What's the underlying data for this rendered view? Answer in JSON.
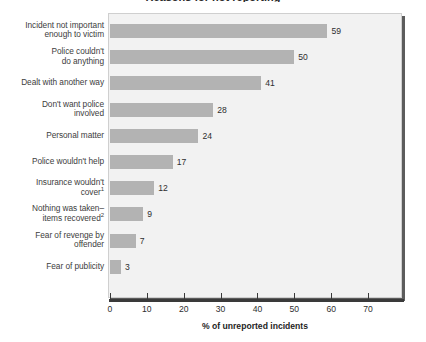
{
  "chart_data": {
    "type": "bar",
    "orientation": "horizontal",
    "title": "Reasons for not reporting",
    "xlabel": "% of unreported incidents",
    "ylabel": "",
    "xlim": [
      0,
      78
    ],
    "xticks": [
      0,
      10,
      20,
      30,
      40,
      50,
      60,
      70
    ],
    "xtick_labels": [
      "0",
      "10",
      "20",
      "30",
      "40",
      "50",
      "60",
      "70"
    ],
    "grid": false,
    "legend": null,
    "categories": [
      "Incident not important enough to victim",
      "Police couldn't do anything",
      "Dealt with another way",
      "Don't want police involved",
      "Personal matter",
      "Police wouldn't help",
      "Insurance wouldn't cover",
      "Nothing was taken–items recovered",
      "Fear of revenge by offender",
      "Fear of publicity"
    ],
    "values": [
      59,
      50,
      41,
      28,
      24,
      17,
      12,
      9,
      7,
      3
    ],
    "value_labels": [
      "59",
      "50",
      "41",
      "28",
      "24",
      "17",
      "12",
      "9",
      "7",
      "3"
    ],
    "bar_color": "#b3b3b3",
    "plot_background": "#f2f2f2",
    "axis_color": "#3a3a3a"
  },
  "rows": [
    {
      "label_lines": [
        "Incident not important",
        "enough to victim"
      ],
      "footnote": "",
      "value": 59,
      "value_label": "59"
    },
    {
      "label_lines": [
        "Police couldn't",
        "do anything"
      ],
      "footnote": "",
      "value": 50,
      "value_label": "50"
    },
    {
      "label_lines": [
        "Dealt with another way"
      ],
      "footnote": "",
      "value": 41,
      "value_label": "41"
    },
    {
      "label_lines": [
        "Don't want police",
        "involved"
      ],
      "footnote": "",
      "value": 28,
      "value_label": "28"
    },
    {
      "label_lines": [
        "Personal matter"
      ],
      "footnote": "",
      "value": 24,
      "value_label": "24"
    },
    {
      "label_lines": [
        "Police wouldn't help"
      ],
      "footnote": "",
      "value": 17,
      "value_label": "17"
    },
    {
      "label_lines": [
        "Insurance wouldn't",
        "cover"
      ],
      "footnote": "1",
      "value": 12,
      "value_label": "12"
    },
    {
      "label_lines": [
        "Nothing was taken–",
        "items recovered"
      ],
      "footnote": "2",
      "value": 9,
      "value_label": "9"
    },
    {
      "label_lines": [
        "Fear of revenge by",
        "offender"
      ],
      "footnote": "",
      "value": 7,
      "value_label": "7"
    },
    {
      "label_lines": [
        "Fear of publicity"
      ],
      "footnote": "",
      "value": 3,
      "value_label": "3"
    }
  ],
  "axis": {
    "x_title": "% of unreported incidents",
    "ticks": [
      "0",
      "10",
      "20",
      "30",
      "40",
      "50",
      "60",
      "70"
    ]
  }
}
